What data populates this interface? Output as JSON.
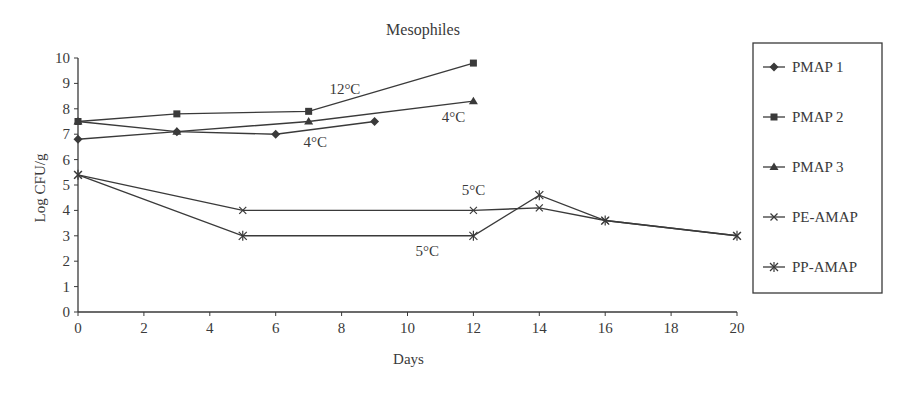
{
  "chart_data": {
    "type": "line",
    "title": "Mesophiles",
    "xlabel": "Days",
    "ylabel": "Log CFU/g",
    "xlim": [
      0,
      20
    ],
    "ylim": [
      0,
      10
    ],
    "xticks": [
      0,
      2,
      4,
      6,
      8,
      10,
      12,
      14,
      16,
      18,
      20
    ],
    "yticks": [
      0,
      1,
      2,
      3,
      4,
      5,
      6,
      7,
      8,
      9,
      10
    ],
    "grid": false,
    "legend_position": "right",
    "series": [
      {
        "name": "PMAP 1",
        "marker": "diamond",
        "x": [
          0,
          3,
          6,
          9
        ],
        "y": [
          6.8,
          7.1,
          7.0,
          7.5
        ]
      },
      {
        "name": "PMAP 2",
        "marker": "square",
        "x": [
          0,
          3,
          7,
          12
        ],
        "y": [
          7.5,
          7.8,
          7.9,
          9.8
        ]
      },
      {
        "name": "PMAP 3",
        "marker": "triangle",
        "x": [
          0,
          3,
          7,
          12
        ],
        "y": [
          7.5,
          7.1,
          7.5,
          8.3
        ]
      },
      {
        "name": "PE-AMAP",
        "marker": "x",
        "x": [
          0,
          5,
          12,
          14,
          16,
          20
        ],
        "y": [
          5.4,
          4.0,
          4.0,
          4.1,
          3.6,
          3.0
        ]
      },
      {
        "name": "PP-AMAP",
        "marker": "star",
        "x": [
          0,
          5,
          12,
          14,
          16,
          20
        ],
        "y": [
          5.4,
          3.0,
          3.0,
          4.6,
          3.6,
          3.0
        ]
      }
    ],
    "annotations": [
      {
        "text": "12°C",
        "x": 8.1,
        "y": 8.6
      },
      {
        "text": "4°C",
        "x": 11.4,
        "y": 7.5
      },
      {
        "text": "4°C",
        "x": 7.2,
        "y": 6.5
      },
      {
        "text": "5°C",
        "x": 12.0,
        "y": 4.6
      },
      {
        "text": "5°C",
        "x": 10.6,
        "y": 2.2
      }
    ]
  }
}
